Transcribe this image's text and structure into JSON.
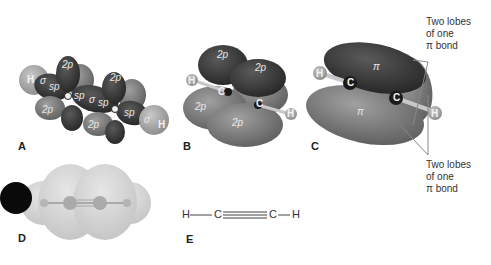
{
  "panels": {
    "a": {
      "label": "A",
      "orbitals": [
        "2p",
        "2p",
        "2p",
        "2p",
        "sp",
        "sp",
        "sp",
        "sp"
      ],
      "sigma": "σ",
      "atoms": [
        "H",
        "H"
      ]
    },
    "b": {
      "label": "B",
      "orbitals": [
        "2p",
        "2p",
        "2p",
        "2p"
      ],
      "atoms": [
        "H",
        "C",
        "C",
        "H"
      ]
    },
    "c": {
      "label": "C",
      "pi": "π",
      "atoms": [
        "H",
        "C",
        "C",
        "H"
      ],
      "annotation_top": [
        "Two lobes",
        "of one",
        "π bond"
      ],
      "annotation_bottom": [
        "Two lobes",
        "of one",
        "π bond"
      ]
    },
    "d": {
      "label": "D"
    },
    "e": {
      "label": "E",
      "formula": {
        "h1": "H",
        "c1": "C",
        "c2": "C",
        "h2": "H"
      }
    }
  },
  "colors": {
    "dark_lobe": "#3a3a3a",
    "mid_lobe": "#7a7a7a",
    "light_lobe": "#9e9e9e",
    "hydrogen": "#b0b0b0",
    "cloud": "#d8d8d8"
  }
}
